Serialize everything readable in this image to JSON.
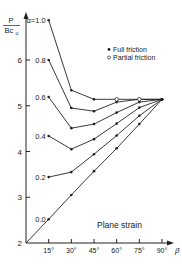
{
  "chart_data": {
    "type": "line",
    "title": "",
    "annotation": "Plane strain",
    "xlabel": "β",
    "ylabel": "P / Bc_u",
    "ylabel_parts": {
      "numerator": "P",
      "denominator": "Bc",
      "subscript": "u"
    },
    "xlim": [
      0,
      90
    ],
    "ylim": [
      2,
      7
    ],
    "x_ticks": [
      15,
      30,
      45,
      60,
      75,
      90
    ],
    "x_tick_labels": [
      "15°",
      "30°",
      "45°",
      "60°",
      "75°",
      "90°"
    ],
    "y_ticks": [
      2,
      3,
      4,
      5,
      6
    ],
    "y_tick_labels": [
      "2",
      "3",
      "4",
      "5",
      "6"
    ],
    "grid": false,
    "legend": {
      "position": "upper right",
      "entries": [
        {
          "marker": "filled-circle",
          "label": "Full friction"
        },
        {
          "marker": "open-circle",
          "label": "Partial friction"
        }
      ]
    },
    "x": [
      15,
      30,
      45,
      60,
      75,
      90
    ],
    "series": [
      {
        "name": "α=1.0",
        "label": "α=1.0",
        "values": [
          6.87,
          5.34,
          5.14,
          5.14,
          5.14,
          5.14
        ]
      },
      {
        "name": "α=0.8",
        "label": "0.8",
        "values": [
          6.0,
          4.95,
          4.88,
          5.08,
          5.14,
          5.14
        ]
      },
      {
        "name": "α=0.6",
        "label": "0.6",
        "values": [
          5.19,
          4.51,
          4.6,
          4.85,
          5.08,
          5.14
        ]
      },
      {
        "name": "α=0.4",
        "label": "0.4",
        "values": [
          4.34,
          4.05,
          4.27,
          4.61,
          4.96,
          5.14
        ]
      },
      {
        "name": "α=0.2",
        "label": "0.2",
        "values": [
          3.44,
          3.55,
          3.94,
          4.35,
          4.78,
          5.14
        ]
      },
      {
        "name": "α=0.0",
        "label": "0.0",
        "values": [
          2.52,
          3.05,
          3.57,
          4.07,
          4.6,
          5.14
        ],
        "origin": [
          0,
          2.0
        ]
      }
    ],
    "partial_friction_points": [
      {
        "x": 60,
        "y": 5.14
      },
      {
        "x": 75,
        "y": 5.14
      }
    ],
    "plateau_value": 5.14
  }
}
